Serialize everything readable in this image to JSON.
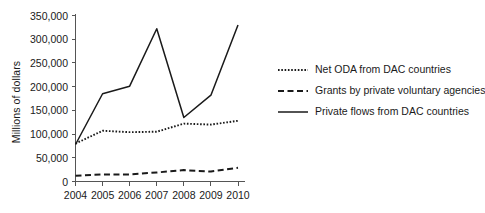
{
  "chart_data": {
    "type": "line",
    "title": "",
    "xlabel": "",
    "ylabel": "Millions of dollars",
    "x": [
      2004,
      2005,
      2006,
      2007,
      2008,
      2009,
      2010
    ],
    "categories": [
      "2004",
      "2005",
      "2006",
      "2007",
      "2008",
      "2009",
      "2010"
    ],
    "xlim": [
      2004,
      2010
    ],
    "ylim": [
      0,
      350000
    ],
    "ytick_values": [
      0,
      50000,
      100000,
      150000,
      200000,
      250000,
      300000,
      350000
    ],
    "ytick_labels": [
      "0",
      "50,000",
      "100,000",
      "150,000",
      "200,000",
      "250,000",
      "300,000",
      "350,000"
    ],
    "grid": false,
    "legend_position": "right",
    "series": [
      {
        "name": "Net ODA from DAC countries",
        "style": "dotted",
        "color": "#1a1a1a",
        "values": [
          80000,
          107000,
          104000,
          105000,
          122000,
          120000,
          128000
        ]
      },
      {
        "name": "Grants by private voluntary agencies",
        "style": "dashed",
        "color": "#1a1a1a",
        "values": [
          12000,
          15000,
          15000,
          19000,
          24000,
          21000,
          29000
        ]
      },
      {
        "name": "Private flows from DAC countries",
        "style": "solid",
        "color": "#1a1a1a",
        "values": [
          78000,
          185000,
          201000,
          322000,
          135000,
          182000,
          330000
        ]
      }
    ]
  },
  "axes": {
    "y_title": "Millions of dollars"
  },
  "legend": {
    "entries": [
      {
        "label": "Net ODA from DAC countries",
        "style": "dotted"
      },
      {
        "label": "Grants by private voluntary agencies",
        "style": "dashed"
      },
      {
        "label": "Private flows from DAC countries",
        "style": "solid"
      }
    ]
  },
  "colors": {
    "ink": "#1a1a1a",
    "axis": "#555555",
    "background": "#ffffff"
  }
}
